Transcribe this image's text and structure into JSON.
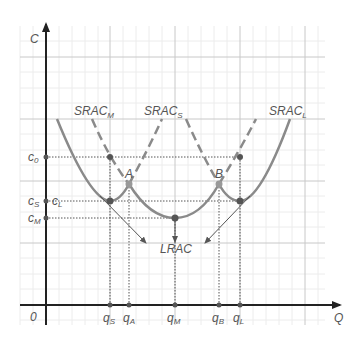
{
  "axes": {
    "y_label": "C",
    "x_label": "Q",
    "origin_label": "0"
  },
  "curves": {
    "srac_m": {
      "name": "SRAC",
      "sub": "M"
    },
    "srac_s": {
      "name": "SRAC",
      "sub": "S"
    },
    "srac_l": {
      "name": "SRAC",
      "sub": "L"
    },
    "lrac": {
      "name": "LRAC"
    }
  },
  "points": {
    "a": "A",
    "b": "B"
  },
  "y_ticks": [
    {
      "name": "c",
      "sub": "0"
    },
    {
      "name": "c",
      "sub": "S"
    },
    {
      "name": "c",
      "sub": "L"
    },
    {
      "name": "c",
      "sub": "M"
    }
  ],
  "x_ticks": [
    {
      "name": "q",
      "sub": "S"
    },
    {
      "name": "q",
      "sub": "A"
    },
    {
      "name": "q",
      "sub": "M"
    },
    {
      "name": "q",
      "sub": "B"
    },
    {
      "name": "q",
      "sub": "L"
    }
  ],
  "colors": {
    "curve": "#8a8a8a",
    "axis": "#333333",
    "grid_major": "#c8c8c8",
    "grid_minor": "#ececec",
    "guide": "#555555"
  }
}
